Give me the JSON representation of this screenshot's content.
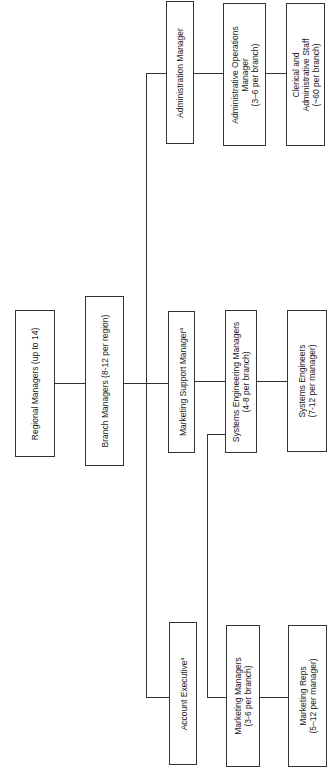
{
  "diagram": {
    "orientation": "rotated-90-ccw",
    "nodes": {
      "regional": {
        "lines": [
          "Regional Managers (up to 14)"
        ]
      },
      "branch": {
        "lines": [
          "Branch Managers (8-12 per region)"
        ]
      },
      "admin_manager": {
        "lines": [
          "Administration Manager"
        ]
      },
      "marketing_support": {
        "lines": [
          "Marketing Support Manager"
        ],
        "note": "a"
      },
      "account_exec": {
        "lines": [
          "Account Executive"
        ],
        "note": "a"
      },
      "admin_ops": {
        "lines": [
          "Administrative Operations",
          "Manager",
          "(3–6 per branch)"
        ]
      },
      "se_managers": {
        "lines": [
          "Systems Engineering Managers",
          "(4-8 per branch)"
        ]
      },
      "marketing_managers": {
        "lines": [
          "Marketing Managers",
          "(3-6 per branch)"
        ]
      },
      "clerical": {
        "lines": [
          "Clerical and",
          "Administrative Staff",
          "(~60 per branch)"
        ]
      },
      "systems_engineers": {
        "lines": [
          "Systems Engineers",
          "(7-12 per manager)"
        ]
      },
      "marketing_reps": {
        "lines": [
          "Marketing Reps",
          "(5–12 per manager)"
        ]
      }
    },
    "edges": [
      [
        "regional",
        "branch"
      ],
      [
        "branch",
        "admin_manager"
      ],
      [
        "branch",
        "marketing_support"
      ],
      [
        "branch",
        "account_exec"
      ],
      [
        "admin_manager",
        "admin_ops"
      ],
      [
        "admin_ops",
        "clerical"
      ],
      [
        "marketing_support",
        "se_managers"
      ],
      [
        "se_managers",
        "systems_engineers"
      ],
      [
        "marketing_support",
        "marketing_managers"
      ],
      [
        "marketing_managers",
        "marketing_reps"
      ]
    ]
  }
}
